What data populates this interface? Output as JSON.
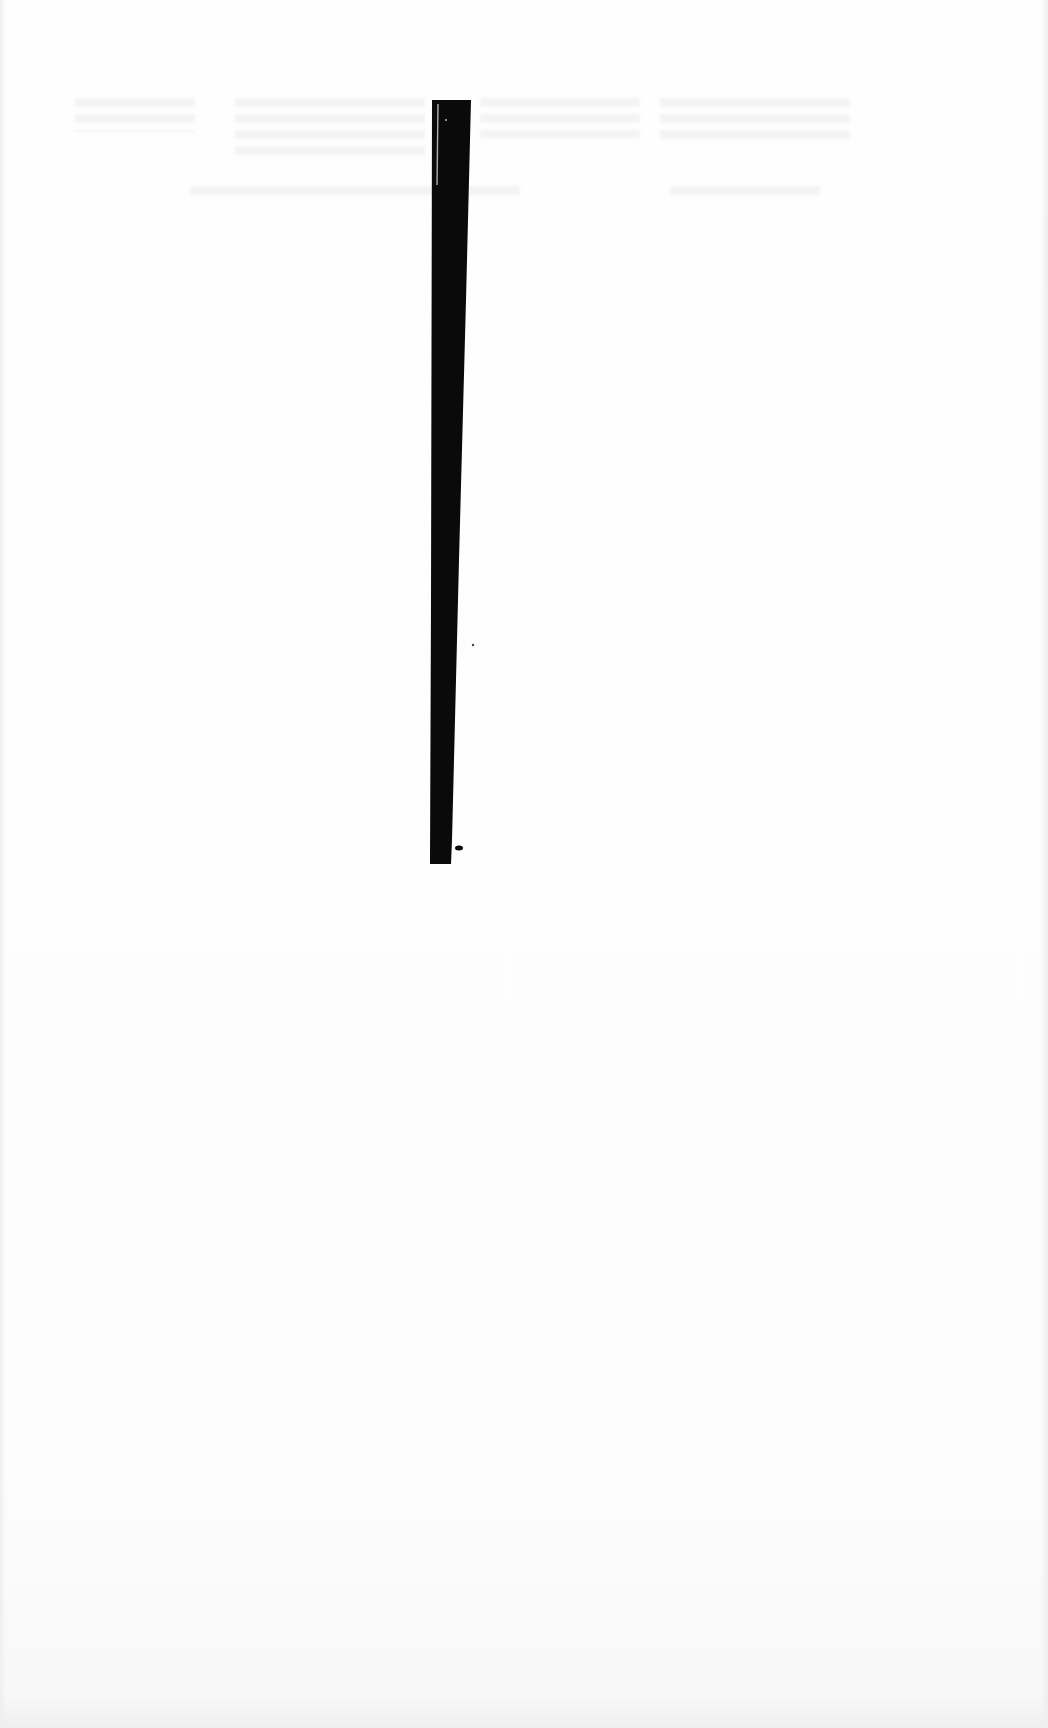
{
  "document": {
    "type": "scanned-page",
    "background_color": "#fdfdfd",
    "legible_text": [],
    "ghost_text_note": "",
    "redaction_bar": {
      "color": "#0a0a0a",
      "top_left": [
        432,
        100
      ],
      "top_right": [
        471,
        100
      ],
      "bottom_right": [
        451,
        864
      ],
      "bottom_left": [
        430,
        864
      ],
      "highlight_line_color": "#d8d8d8"
    }
  }
}
